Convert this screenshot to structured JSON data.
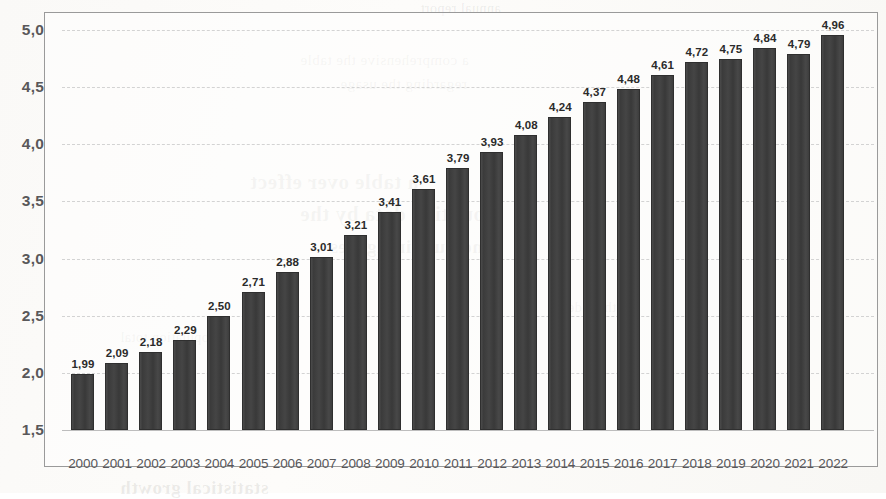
{
  "chart_data": {
    "type": "bar",
    "title": "",
    "subtitle": "",
    "xlabel": "",
    "ylabel": "",
    "ylim": [
      1.5,
      5.0
    ],
    "ytick_labels": [
      "5,0",
      "4,5",
      "4,0",
      "3,5",
      "3,0",
      "2,5",
      "2,0",
      "1,5"
    ],
    "ytick_values": [
      5.0,
      4.5,
      4.0,
      3.5,
      3.0,
      2.5,
      2.0,
      1.5
    ],
    "grid": true,
    "grid_style": "dashed-horizontal",
    "legend": null,
    "decimal_separator": ",",
    "bar_color": "#3f3f3f",
    "grid_color": "#d3d3d3",
    "axis_text_color": "#59585a",
    "frame_color": "#9a9a9a",
    "categories": [
      "2000",
      "2001",
      "2002",
      "2003",
      "2004",
      "2005",
      "2006",
      "2007",
      "2008",
      "2009",
      "2010",
      "2011",
      "2012",
      "2013",
      "2014",
      "2015",
      "2016",
      "2017",
      "2018",
      "2019",
      "2020",
      "2021",
      "2022"
    ],
    "values": [
      1.99,
      2.09,
      2.18,
      2.29,
      2.5,
      2.71,
      2.88,
      3.01,
      3.21,
      3.41,
      3.61,
      3.79,
      3.93,
      4.08,
      4.24,
      4.37,
      4.48,
      4.61,
      4.72,
      4.75,
      4.84,
      4.79,
      4.96
    ],
    "value_labels": [
      "1,99",
      "2,09",
      "2,18",
      "2,29",
      "2,50",
      "2,71",
      "2,88",
      "3,01",
      "3,21",
      "3,41",
      "3,61",
      "3,79",
      "3,93",
      "4,08",
      "4,24",
      "4,37",
      "4,48",
      "4,61",
      "4,72",
      "4,75",
      "4,84",
      "4,79",
      "4,96"
    ]
  },
  "bleed_through": {
    "line1": "a comprehensive the table",
    "line2": "regarding the usage",
    "line3": "a table over effect",
    "line4": "counting data by the",
    "line5": "measure in figures",
    "line6": "statistical growth",
    "line7": "annual report",
    "line8": "to the index",
    "line9": "population total"
  }
}
